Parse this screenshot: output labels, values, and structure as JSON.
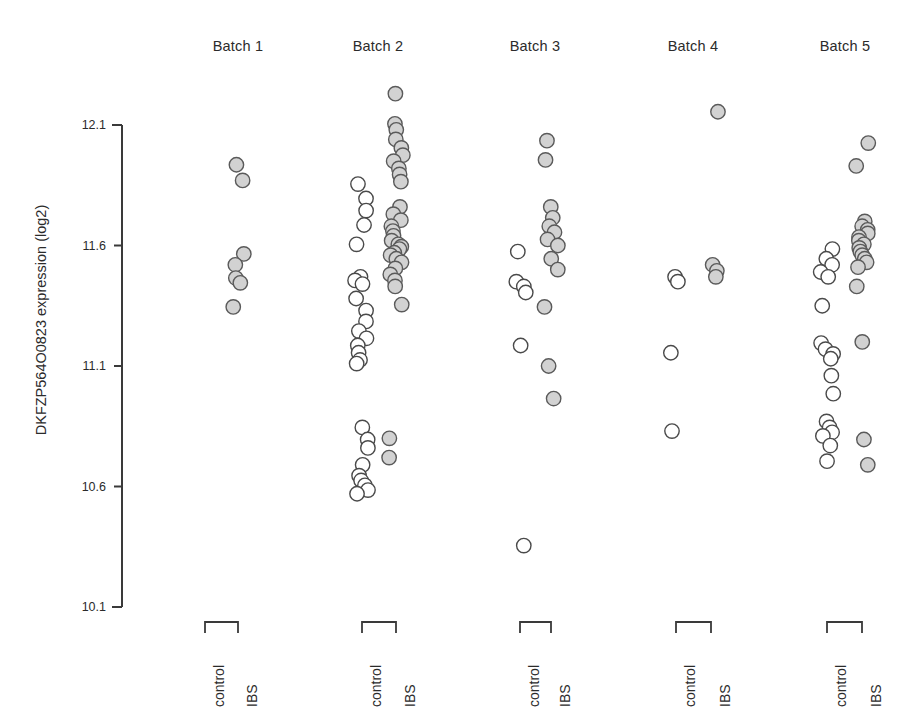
{
  "figure": {
    "width": 916,
    "height": 727,
    "background": "#ffffff",
    "axis_color": "#3a3a3a",
    "text_color": "#2b2b2b"
  },
  "chart_data": {
    "type": "scatter",
    "title": "",
    "subtitle": "",
    "xlabel": "",
    "ylabel": "DKFZP564O0823 expression (log2)",
    "ylim": [
      10.1,
      12.1
    ],
    "yticks": [
      12.1,
      11.6,
      11.1,
      10.6,
      10.1
    ],
    "ytick_labels": [
      "12.1",
      "11.6",
      "11.1",
      "10.6",
      "10.1"
    ],
    "grid": false,
    "legend": "none",
    "panel_labels": [
      "Batch 1",
      "Batch 2",
      "Batch 3",
      "Batch 4",
      "Batch 5"
    ],
    "group_labels": [
      "control",
      "IBS"
    ],
    "marker_styles": {
      "control": {
        "fill": "#ffffff",
        "stroke": "#4a4a4a",
        "radius": 7.2
      },
      "IBS": {
        "fill": "#d2d2d2",
        "stroke": "#5a5a5a",
        "radius": 7.2
      }
    },
    "panels": [
      {
        "name": "Batch 1",
        "center_x": 238,
        "control_x": 205,
        "ibs_x": 238,
        "series": [
          {
            "name": "control",
            "values": []
          },
          {
            "name": "IBS",
            "values": [
              11.935,
              11.87,
              11.565,
              11.52,
              11.465,
              11.445,
              11.345
            ]
          }
        ]
      },
      {
        "name": "Batch 2",
        "center_x": 378,
        "control_x": 362,
        "ibs_x": 396,
        "series": [
          {
            "name": "control",
            "values": [
              11.855,
              11.795,
              11.745,
              11.685,
              11.605,
              11.47,
              11.455,
              11.44,
              11.38,
              11.33,
              11.285,
              11.245,
              11.215,
              11.185,
              11.155,
              11.125,
              11.11,
              10.845,
              10.795,
              10.76,
              10.69,
              10.645,
              10.625,
              10.605,
              10.585,
              10.57
            ]
          },
          {
            "name": "IBS",
            "values": [
              12.23,
              12.105,
              12.08,
              12.04,
              12.005,
              11.975,
              11.95,
              11.92,
              11.895,
              11.865,
              11.76,
              11.73,
              11.705,
              11.68,
              11.66,
              11.64,
              11.62,
              11.605,
              11.595,
              11.585,
              11.57,
              11.56,
              11.545,
              11.53,
              11.505,
              11.48,
              11.455,
              11.43,
              11.355,
              10.8,
              10.72
            ]
          }
        ]
      },
      {
        "name": "Batch 3",
        "center_x": 535,
        "control_x": 520,
        "ibs_x": 551,
        "series": [
          {
            "name": "control",
            "values": [
              11.575,
              11.45,
              11.43,
              11.405,
              11.185,
              10.355
            ]
          },
          {
            "name": "IBS",
            "values": [
              12.035,
              11.955,
              11.76,
              11.715,
              11.68,
              11.655,
              11.625,
              11.6,
              11.545,
              11.5,
              11.345,
              11.1,
              10.965
            ]
          }
        ]
      },
      {
        "name": "Batch 4",
        "center_x": 693,
        "control_x": 676,
        "ibs_x": 711,
        "series": [
          {
            "name": "control",
            "values": [
              11.47,
              11.45,
              11.155,
              10.83
            ]
          },
          {
            "name": "IBS",
            "values": [
              12.155,
              11.52,
              11.495,
              11.47
            ]
          }
        ]
      },
      {
        "name": "Batch 5",
        "center_x": 845,
        "control_x": 827,
        "ibs_x": 862,
        "series": [
          {
            "name": "control",
            "values": [
              11.585,
              11.545,
              11.52,
              11.49,
              11.47,
              11.35,
              11.195,
              11.17,
              11.15,
              11.13,
              11.06,
              10.985,
              10.87,
              10.845,
              10.825,
              10.81,
              10.77,
              10.705
            ]
          },
          {
            "name": "IBS",
            "values": [
              12.025,
              11.93,
              11.7,
              11.68,
              11.665,
              11.65,
              11.635,
              11.62,
              11.605,
              11.59,
              11.575,
              11.56,
              11.545,
              11.53,
              11.51,
              11.43,
              11.2,
              10.795,
              10.69
            ]
          }
        ]
      }
    ]
  },
  "axis": {
    "x_pos": 122,
    "y_top": 125,
    "y_bottom": 607,
    "tick_length": 8,
    "cap_length": 10
  },
  "brackets": {
    "y": 622,
    "drop": 11,
    "label_y": 637
  }
}
